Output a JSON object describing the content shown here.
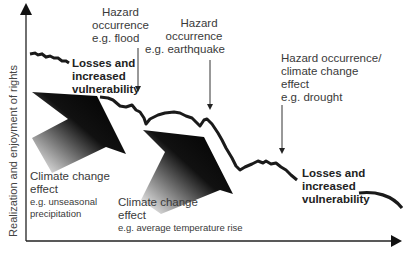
{
  "axes": {
    "y_label": "Realization and enjoyment of rights"
  },
  "annotations": {
    "hazard_flood": [
      "Hazard",
      "occurrence",
      "e.g. flood"
    ],
    "hazard_earthquake": [
      "Hazard",
      "occurrence",
      "e.g. earthquake"
    ],
    "hazard_drought": [
      "Hazard occurrence/",
      "climate change",
      "effect",
      "e.g. drought"
    ],
    "losses_1": [
      "Losses and",
      "increased",
      "vulnerability"
    ],
    "losses_2": [
      "Losses and",
      "increased",
      "vulnerability"
    ],
    "climate_1": {
      "title": [
        "Climate change",
        "effect"
      ],
      "example": [
        "e.g. unseasonal",
        "precipitation"
      ]
    },
    "climate_2": {
      "title": [
        "Climate change",
        "effect"
      ],
      "example": [
        "e.g. average temperature rise"
      ]
    }
  },
  "colors": {
    "line": "#1a1a1a",
    "axis": "#222222",
    "text": "#3a3a3a"
  }
}
